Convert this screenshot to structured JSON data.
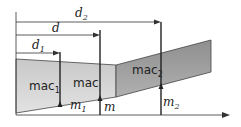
{
  "diagram": {
    "colors": {
      "inner_panel": "#d4d4d4",
      "outer_panel": "#9e9e9e",
      "lines": "#222222"
    },
    "dimensions": [
      {
        "label": "d",
        "sub": "1"
      },
      {
        "label": "d",
        "sub": ""
      },
      {
        "label": "d",
        "sub": "2"
      }
    ],
    "panels": [
      {
        "label": "mac",
        "sub": "1"
      },
      {
        "label": "mac",
        "sub": ""
      },
      {
        "label": "mac",
        "sub": "2"
      }
    ],
    "points": [
      {
        "label": "m",
        "sub": "1"
      },
      {
        "label": "m",
        "sub": ""
      },
      {
        "label": "m",
        "sub": "2"
      }
    ]
  }
}
